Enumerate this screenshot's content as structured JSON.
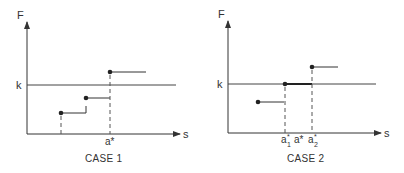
{
  "case1": {
    "caption": "CASE 1",
    "y_axis_label": "F",
    "x_axis_label": "s",
    "threshold_label": "k",
    "x_tick_label": "a*",
    "steps": [
      {
        "x_start": 61,
        "x_end": 86,
        "y": 113
      },
      {
        "x_start": 86,
        "x_end": 110,
        "y": 98
      },
      {
        "x_start": 110,
        "x_end": 146,
        "y": 72
      }
    ]
  },
  "case2": {
    "caption": "CASE 2",
    "y_axis_label": "F",
    "x_axis_label": "s",
    "threshold_label": "k",
    "x_tick_labels": {
      "a1": "a",
      "a1_sup": "*",
      "a1_sub": "1",
      "a": "a*",
      "a2": "a",
      "a2_sup": "*",
      "a2_sub": "2"
    },
    "steps": [
      {
        "x_start": 258,
        "x_end": 284,
        "y": 102
      },
      {
        "x_start": 285,
        "x_end": 312,
        "y": 84
      },
      {
        "x_start": 312,
        "x_end": 338,
        "y": 67
      }
    ]
  },
  "colors": {
    "line": "#333333",
    "dashed": "#555555"
  }
}
